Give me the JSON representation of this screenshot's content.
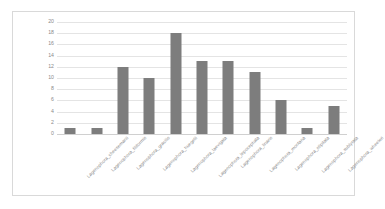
{
  "chart_data": {
    "type": "bar",
    "title": "",
    "subtitle": "",
    "xlabel": "",
    "ylabel": "",
    "ylim": [
      0,
      20
    ],
    "yticks": [
      0,
      2,
      4,
      6,
      8,
      10,
      12,
      14,
      16,
      18,
      20
    ],
    "grid": true,
    "legend": false,
    "legend_position": "none",
    "bar_color": "#7d7d7d",
    "gridline_color": "#e4e4e4",
    "frame_color": "#d9d9d9",
    "tick_label_color": "#8a8a8a",
    "categories": [
      "Lagenophora_cheesemanii",
      "Lagenophora_filiformis",
      "Lagenophora_gracilis",
      "Lagenophora_huegelii",
      "Lagenophora_laevigata",
      "Lagenophora_lepocephala",
      "Lagenophora_linaris",
      "Lagenophora_montana",
      "Lagenophora_stipitata",
      "Lagenophora_sublyrata",
      "Lagenophora_wheeleri"
    ],
    "values": [
      1,
      1,
      12,
      10,
      18,
      13,
      13,
      11,
      6,
      1,
      5
    ]
  }
}
